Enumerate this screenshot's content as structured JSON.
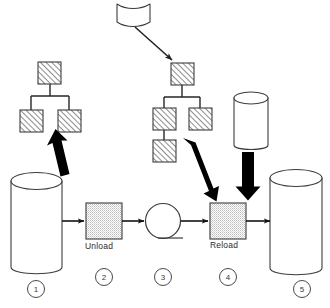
{
  "diagram": {
    "colors": {
      "stroke": "#3c3c3c",
      "arrow_thin": "#1a1a1a",
      "arrow_thick": "#000000",
      "hatch": "#555555",
      "stipple": "#8a8a8a",
      "text": "#2b2b2b",
      "background": "#ffffff"
    },
    "process_labels": {
      "unload": "Unload",
      "reload": "Reload"
    },
    "step_numbers": [
      {
        "id": "step-1",
        "label": "1"
      },
      {
        "id": "step-2",
        "label": "2"
      },
      {
        "id": "step-3",
        "label": "3"
      },
      {
        "id": "step-4",
        "label": "4"
      },
      {
        "id": "step-5",
        "label": "5"
      }
    ],
    "nodes": {
      "source_database": {
        "name": "source-database-cylinder",
        "step": "1"
      },
      "unload_process": {
        "name": "unload-process-box",
        "step": "2"
      },
      "transfer_media": {
        "name": "transfer-media-circle",
        "step": "3"
      },
      "reload_process": {
        "name": "reload-process-box",
        "step": "4"
      },
      "target_database": {
        "name": "target-database-cylinder",
        "step": "5"
      },
      "source_schema_tree": {
        "name": "source-schema-tree",
        "boxes": 3
      },
      "target_schema_tree": {
        "name": "target-schema-tree",
        "boxes": 4
      },
      "schema_definition_doc": {
        "name": "schema-definition-document"
      },
      "reference_store": {
        "name": "reference-store-cylinder"
      }
    }
  }
}
